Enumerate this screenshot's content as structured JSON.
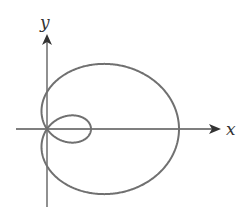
{
  "diagram": {
    "type": "polar-curve",
    "equation_form": "r = a + b cos(theta)",
    "a": 1,
    "b": 2,
    "axes": {
      "x_label": "x",
      "y_label": "y"
    },
    "colors": {
      "curve": "#707070",
      "axes": "#555555",
      "background": "#ffffff"
    }
  }
}
